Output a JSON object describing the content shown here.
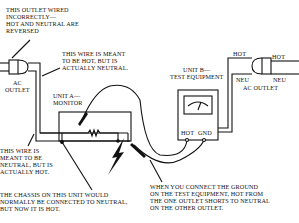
{
  "diagram": {
    "outlet_note": "THIS OUTLET WIRED\nINCORRECTLY—\nHOT AND NEUTRAL ARE\nREVERSED",
    "hot_wire_note": "THIS WIRE IS MEANT\nTO BE HOT, BUT IS\nACTUALLY NEUTRAL.",
    "left_outlet_label": "AC\nOUTLET",
    "unit_a_label": "UNIT A—\nMONITOR",
    "unit_b_label": "UNIT B—\nTEST EQUIPMENT",
    "neutral_wire_note": "THIS WIRE IS\nMEANT TO BE\nNEUTRAL, BUT IS\nACTUALLY HOT.",
    "chassis_note": "THE CHASSIS ON THIS UNIT WOULD\nNORMALLY BE CONNECTED TO NEUTRAL,\nBUT NOW IT IS HOT.",
    "ground_note": "WHEN YOU CONNECT THE GROUND\nON THE TEST EQUIPMENT, HOT FROM\nTHE ONE OUTLET SHORTS TO NEUTRAL\nON THE OTHER OUTLET.",
    "terminal_hot": "HOT",
    "terminal_gnd": "GND",
    "right_outlet": {
      "hot_left": "HOT",
      "hot_right": "HOT",
      "neu_left": "NEU",
      "neu_right": "NEU",
      "label": "AC OUTLET"
    }
  }
}
